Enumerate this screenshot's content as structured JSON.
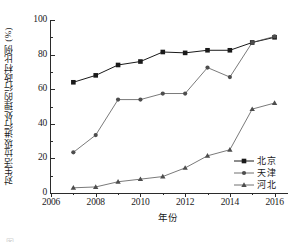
{
  "chart_data": {
    "type": "line",
    "title": "",
    "xlabel": "年份",
    "ylabel": "对生活垃圾进行处理的行政村比例 (%)",
    "x": [
      2007,
      2008,
      2009,
      2010,
      2011,
      2012,
      2013,
      2014,
      2015,
      2016
    ],
    "xlim": [
      2006,
      2016.6
    ],
    "ylim": [
      0,
      100
    ],
    "xticks": [
      2006,
      2008,
      2010,
      2012,
      2014,
      2016
    ],
    "xtick_labels": [
      "2006",
      "2008",
      "2010",
      "2012",
      "2014",
      "2016"
    ],
    "xminor_ticks": [
      2007,
      2009,
      2011,
      2013,
      2015
    ],
    "yticks": [
      0,
      20,
      40,
      60,
      80,
      100
    ],
    "ytick_labels": [
      "0",
      "20",
      "40",
      "60",
      "80",
      "100"
    ],
    "yminor_ticks": [
      10,
      30,
      50,
      70,
      90
    ],
    "grid": false,
    "legend_position": "lower-right",
    "series": [
      {
        "name": "北京",
        "marker": "square",
        "color": "#1a1a1a",
        "values": [
          64,
          68,
          74,
          76,
          81.5,
          81,
          82.5,
          82.5,
          87,
          90
        ]
      },
      {
        "name": "天津",
        "marker": "circle",
        "color": "#4d4d4d",
        "values": [
          23.5,
          33.5,
          54,
          54,
          57.5,
          57.5,
          72.5,
          67,
          87,
          90.5
        ]
      },
      {
        "name": "河北",
        "marker": "triangle",
        "color": "#4d4d4d",
        "values": [
          3,
          3.5,
          6.5,
          8,
          9.5,
          14.5,
          21.5,
          25,
          48.5,
          52
        ]
      }
    ]
  },
  "caption": "图"
}
